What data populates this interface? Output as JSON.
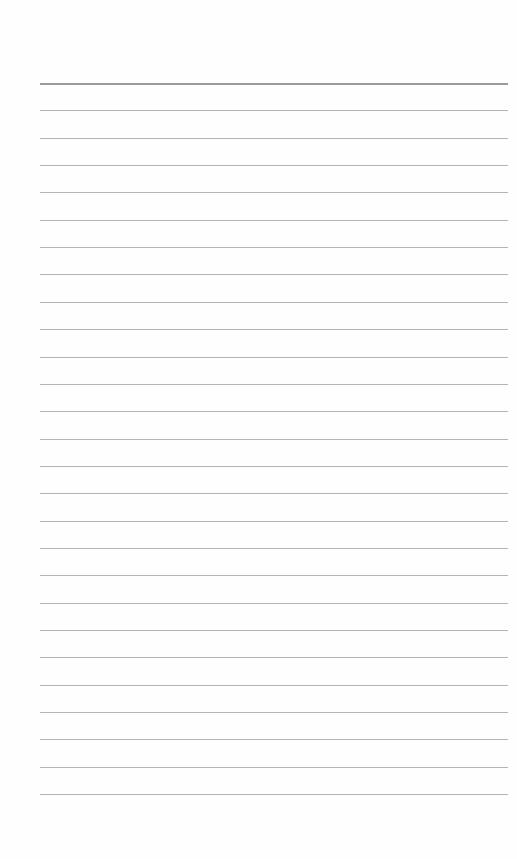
{
  "page": {
    "type": "lined-paper",
    "background_color": "#fefefe",
    "line_color": "#b4b4b4",
    "header_line_color": "#9a9a9a",
    "line_count": 27,
    "first_line_y": 83,
    "line_spacing": 27.35,
    "line_left": 40,
    "line_width": 468,
    "lines_text": []
  }
}
